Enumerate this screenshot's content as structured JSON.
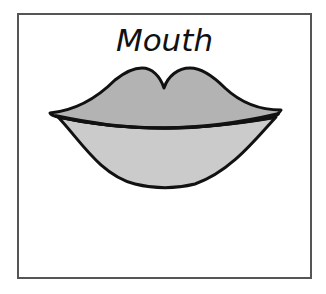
{
  "card": {
    "title": "Mouth",
    "illustration": "lips-icon"
  },
  "colors": {
    "border": "#555555",
    "outline": "#111111",
    "upper_lip": "#b3b3b3",
    "lower_lip": "#cbcbcb",
    "background": "#ffffff"
  }
}
